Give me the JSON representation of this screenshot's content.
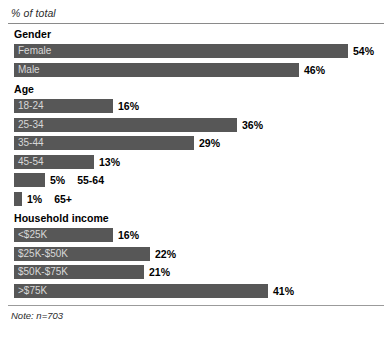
{
  "header": {
    "axis_title": "% of total"
  },
  "footer": {
    "note": "Note: n=703"
  },
  "chart_data": {
    "type": "bar",
    "title": "% of total",
    "subtitle": "",
    "xlabel": "",
    "ylabel": "",
    "orientation": "horizontal",
    "grid": false,
    "legend": "none",
    "xlim": [
      0,
      54
    ],
    "value_suffix": "%",
    "annotation": "Note: n=703",
    "sample_size": 703,
    "sections": [
      {
        "name": "Gender",
        "categories": [
          "Female",
          "Male"
        ],
        "values": [
          54,
          46
        ],
        "value_labels": [
          "54%",
          "46%"
        ]
      },
      {
        "name": "Age",
        "categories": [
          "18-24",
          "25-34",
          "35-44",
          "45-54",
          "55-64",
          "65+"
        ],
        "values": [
          16,
          36,
          29,
          13,
          5,
          1
        ],
        "value_labels": [
          "16%",
          "36%",
          "29%",
          "13%",
          "5%",
          "1%"
        ]
      },
      {
        "name": "Household income",
        "categories": [
          "<$25K",
          "$25K-$50K",
          "$50K-$75K",
          ">$75K"
        ],
        "values": [
          16,
          22,
          21,
          41
        ],
        "value_labels": [
          "16%",
          "22%",
          "21%",
          "41%"
        ]
      }
    ]
  },
  "style": {
    "bar_color": "#575757",
    "bar_label_color": "#d8d8d8",
    "value_color": "#000000",
    "rule_color": "#8a8a8a",
    "background": "#ffffff",
    "px_per_percent": 6.19,
    "bar_height_px": 14
  }
}
